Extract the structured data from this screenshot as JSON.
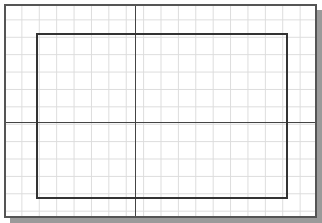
{
  "canvas": {
    "description": "Drawing sheet with grid, border frame, inner rectangle and crosshair axes",
    "grid_color": "#dcdcdc",
    "frame_color": "#555555",
    "shadow_color": "#9a9a9a",
    "line_color": "#333333"
  }
}
